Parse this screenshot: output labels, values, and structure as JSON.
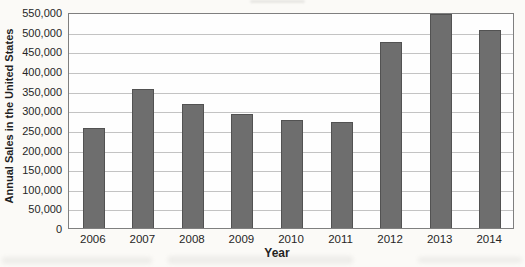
{
  "page": {
    "background_color": "#fbfaf7"
  },
  "chart_data": {
    "type": "bar",
    "title": "",
    "xlabel": "Year",
    "ylabel": "Annual Sales in the United States",
    "categories": [
      "2006",
      "2007",
      "2008",
      "2009",
      "2010",
      "2011",
      "2012",
      "2013",
      "2014"
    ],
    "values": [
      255000,
      355000,
      315000,
      290000,
      275000,
      270000,
      475000,
      545000,
      505000
    ],
    "ylim": [
      0,
      550000
    ],
    "ytick_interval": 50000,
    "ytick_values": [
      0,
      50000,
      100000,
      150000,
      200000,
      250000,
      300000,
      350000,
      400000,
      450000,
      500000,
      550000
    ],
    "ytick_labels": [
      "0",
      "50,000",
      "100,000",
      "150,000",
      "200,000",
      "250,000",
      "300,000",
      "350,000",
      "400,000",
      "450,000",
      "500,000",
      "550,000"
    ],
    "grid": "horizontal",
    "legend": "none",
    "colors": {
      "bar_fill": "#6e6e6e",
      "bar_border": "#525252",
      "gridline": "#c3c3c3",
      "plot_border": "#7f7f7f",
      "text": "#262626"
    }
  }
}
